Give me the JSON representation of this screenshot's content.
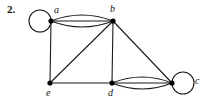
{
  "figure": {
    "number_label": "2.",
    "type": "undirected-multigraph",
    "background_color": "#ffffff",
    "stroke_color": "#1a1a1a",
    "vertex_color": "#000000"
  },
  "vertices": [
    {
      "id": "a",
      "label": "a",
      "x": 51,
      "y": 21,
      "label_x": 54,
      "label_y": 5,
      "has_loop": true,
      "loop_side": "left"
    },
    {
      "id": "b",
      "label": "b",
      "x": 113,
      "y": 21,
      "label_x": 110,
      "label_y": 4,
      "has_loop": false,
      "loop_side": ""
    },
    {
      "id": "c",
      "label": "c",
      "x": 172,
      "y": 83,
      "label_x": 195,
      "label_y": 76,
      "has_loop": true,
      "loop_side": "right"
    },
    {
      "id": "d",
      "label": "d",
      "x": 112,
      "y": 83,
      "label_x": 108,
      "label_y": 88,
      "has_loop": false,
      "loop_side": ""
    },
    {
      "id": "e",
      "label": "e",
      "x": 50,
      "y": 83,
      "label_x": 46,
      "label_y": 88,
      "has_loop": false,
      "loop_side": ""
    }
  ],
  "edges": [
    {
      "from": "a",
      "to": "b",
      "multiplicity": 3,
      "style": "multi-arc-horizontal"
    },
    {
      "from": "d",
      "to": "c",
      "multiplicity": 3,
      "style": "multi-arc-horizontal"
    },
    {
      "from": "a",
      "to": "e",
      "multiplicity": 1,
      "style": "straight"
    },
    {
      "from": "b",
      "to": "e",
      "multiplicity": 1,
      "style": "straight"
    },
    {
      "from": "b",
      "to": "d",
      "multiplicity": 1,
      "style": "straight"
    },
    {
      "from": "b",
      "to": "c",
      "multiplicity": 1,
      "style": "straight"
    },
    {
      "from": "e",
      "to": "d",
      "multiplicity": 1,
      "style": "straight"
    },
    {
      "from": "a",
      "to": "a",
      "multiplicity": 1,
      "style": "self-loop"
    },
    {
      "from": "c",
      "to": "c",
      "multiplicity": 1,
      "style": "self-loop"
    }
  ],
  "loops": [
    {
      "at": "a",
      "cx": 40,
      "cy": 21,
      "r": 11
    },
    {
      "at": "c",
      "cx": 183,
      "cy": 83,
      "r": 11
    }
  ],
  "arc_bundles": [
    {
      "from": "a",
      "to": "b",
      "x1": 51,
      "y1": 21,
      "x2": 113,
      "y2": 21,
      "offsets": [
        -6,
        0,
        6
      ]
    },
    {
      "from": "d",
      "to": "c",
      "x1": 112,
      "y1": 83,
      "x2": 172,
      "y2": 83,
      "offsets": [
        -6,
        0,
        6
      ]
    }
  ]
}
